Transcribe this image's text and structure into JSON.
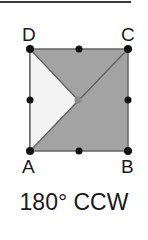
{
  "figure": {
    "vertices": {
      "A": {
        "label": "A",
        "x": 30,
        "y": 151
      },
      "B": {
        "label": "B",
        "x": 128,
        "y": 151
      },
      "C": {
        "label": "C",
        "x": 128,
        "y": 49
      },
      "D": {
        "label": "D",
        "x": 30,
        "y": 49
      }
    },
    "center": {
      "x": 78,
      "y": 100
    },
    "midpoints": [
      {
        "x": 79,
        "y": 49
      },
      {
        "x": 30,
        "y": 100
      },
      {
        "x": 128,
        "y": 100
      },
      {
        "x": 79,
        "y": 151
      }
    ],
    "colors": {
      "shaded_fill": "#a3a3a3",
      "light_fill": "#f3f3f3",
      "edge": "#666666",
      "dot": "#111111",
      "center_dot": "#8a8a8a",
      "top_rule": "#3a3a3a"
    }
  },
  "caption": "180° CCW"
}
